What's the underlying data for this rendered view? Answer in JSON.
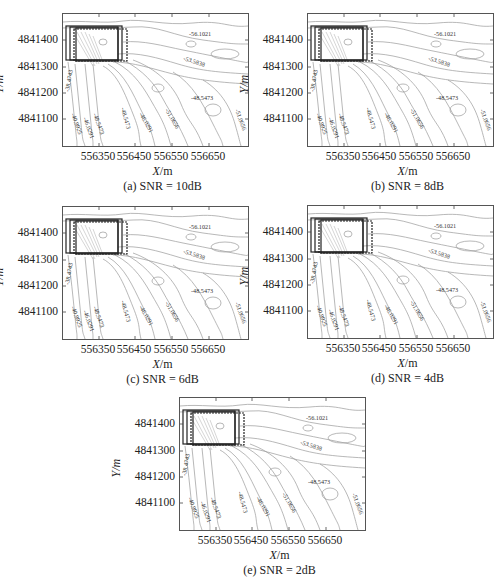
{
  "figure": {
    "panels": [
      {
        "id": "a",
        "caption": "(a) SNR = 10dB"
      },
      {
        "id": "b",
        "caption": "(b) SNR = 8dB"
      },
      {
        "id": "c",
        "caption": "(c) SNR = 6dB"
      },
      {
        "id": "d",
        "caption": "(d) SNR = 4dB"
      },
      {
        "id": "e",
        "caption": "(e) SNR = 2dB"
      }
    ],
    "xlabel_var": "X",
    "xlabel_unit": "/m",
    "ylabel": "Y/m",
    "xticks": [
      "556350",
      "556450",
      "556550",
      "556650"
    ],
    "yticks": [
      "4841400",
      "4841300",
      "4841200",
      "4841100"
    ],
    "contour_labels": [
      "-56.1021",
      "-53.5838",
      "-48.5473",
      "-51.0656",
      "-38.4743",
      "-40.9925",
      "-46.0291",
      "-48.5473",
      "-48.5473",
      "-46.0291",
      "-51.0656"
    ]
  },
  "chart_data": [
    {
      "type": "contour",
      "title": "(a) SNR = 10dB",
      "xlabel": "X/m",
      "ylabel": "Y/m",
      "xticks": [
        556350,
        556450,
        556550,
        556650
      ],
      "yticks": [
        4841100,
        4841200,
        4841300,
        4841400
      ],
      "xlim": [
        556250,
        556760
      ],
      "ylim": [
        4841000,
        4841490
      ],
      "contour_levels": [
        -38.4743,
        -40.9925,
        -46.0291,
        -48.5473,
        -51.0656,
        -53.5838,
        -56.1021
      ],
      "annotations": "overlaid rectangular bounding boxes near (556260-556380, 4841320-4841450)"
    },
    {
      "type": "contour",
      "title": "(b) SNR = 8dB",
      "xlabel": "X/m",
      "ylabel": "Y/m",
      "xticks": [
        556350,
        556450,
        556550,
        556650
      ],
      "yticks": [
        4841100,
        4841200,
        4841300,
        4841400
      ],
      "contour_levels": [
        -38.4743,
        -40.9925,
        -46.0291,
        -48.5473,
        -51.0656,
        -53.5838,
        -56.1021
      ]
    },
    {
      "type": "contour",
      "title": "(c) SNR = 6dB",
      "xlabel": "X/m",
      "ylabel": "Y/m",
      "xticks": [
        556350,
        556450,
        556550,
        556650
      ],
      "yticks": [
        4841100,
        4841200,
        4841300,
        4841400
      ],
      "contour_levels": [
        -38.4743,
        -40.9925,
        -46.0291,
        -48.5473,
        -51.0656,
        -53.5838,
        -56.1021
      ]
    },
    {
      "type": "contour",
      "title": "(d) SNR = 4dB",
      "xlabel": "X/m",
      "ylabel": "Y/m",
      "xticks": [
        556350,
        556450,
        556550,
        556650
      ],
      "yticks": [
        4841100,
        4841200,
        4841300,
        4841400
      ],
      "contour_levels": [
        -38.4743,
        -40.9925,
        -46.0291,
        -48.5473,
        -51.0656,
        -53.5838,
        -56.1021
      ]
    },
    {
      "type": "contour",
      "title": "(e) SNR = 2dB",
      "xlabel": "X/m",
      "ylabel": "Y/m",
      "xticks": [
        556350,
        556450,
        556550,
        556650
      ],
      "yticks": [
        4841100,
        4841200,
        4841300,
        4841400
      ],
      "contour_levels": [
        -38.4743,
        -40.9925,
        -46.0291,
        -48.5473,
        -51.0656,
        -53.5838,
        -56.1021
      ]
    }
  ]
}
